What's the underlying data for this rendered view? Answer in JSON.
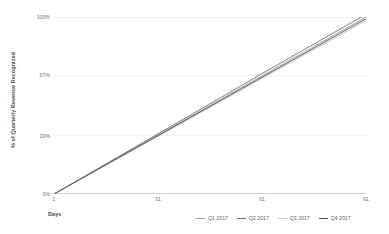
{
  "chart_data": {
    "type": "line",
    "title": "",
    "xlabel": "Days",
    "ylabel": "% of Quarterly Revenue Recognized",
    "xlim": [
      1,
      91
    ],
    "ylim": [
      0,
      100
    ],
    "grid": "horizontal",
    "legend_position": "bottom-right",
    "x_ticks": [
      {
        "value": 1,
        "label": "1"
      },
      {
        "value": 31,
        "label": "31"
      },
      {
        "value": 61,
        "label": "61"
      },
      {
        "value": 91,
        "label": "91"
      }
    ],
    "y_ticks": [
      {
        "value": 100,
        "label": "100%"
      },
      {
        "value": 67,
        "label": "67%"
      },
      {
        "value": 33,
        "label": "33%"
      },
      {
        "value": 0,
        "label": "0%"
      }
    ],
    "series": [
      {
        "name": "Q1 2017",
        "color": "#9a9a9a",
        "x": [
          1,
          31,
          61,
          91
        ],
        "values": [
          0,
          33.3,
          66.7,
          100
        ]
      },
      {
        "name": "Q2 2017",
        "color": "#6d6d6d",
        "x": [
          1,
          31,
          61,
          91
        ],
        "values": [
          0,
          34.0,
          68.0,
          101.5
        ]
      },
      {
        "name": "Q3 2017",
        "color": "#c2c2c2",
        "x": [
          1,
          31,
          61,
          91
        ],
        "values": [
          0,
          32.6,
          65.3,
          98.0
        ]
      },
      {
        "name": "Q4 2017",
        "color": "#4f4f4f",
        "x": [
          1,
          31,
          61,
          91
        ],
        "values": [
          0,
          33.0,
          66.0,
          99.0
        ]
      }
    ]
  },
  "axes": {
    "y_title": "% of Quarterly Revenue Recognized",
    "x_title": "Days"
  },
  "colors": {
    "background": "#ffffff",
    "gridline": "#efefef",
    "axis": "#d0d0d0",
    "tick_text": "#6e6e6e"
  }
}
